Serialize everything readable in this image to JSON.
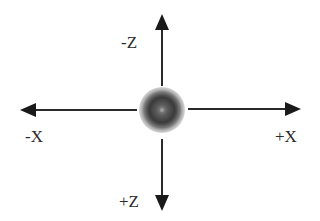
{
  "diagram": {
    "type": "coordinate-axes",
    "center": {
      "x": 162,
      "y": 110
    },
    "sphere": {
      "radius": 23,
      "color_outer": "#9a9a9a",
      "color_mid": "#3a3a3a",
      "color_inner": "#5a5a5a"
    },
    "line_color": "#2a2a2a",
    "axes": [
      {
        "id": "neg-z",
        "label": "-Z",
        "direction": "up"
      },
      {
        "id": "pos-z",
        "label": "+Z",
        "direction": "down"
      },
      {
        "id": "neg-x",
        "label": "-X",
        "direction": "left"
      },
      {
        "id": "pos-x",
        "label": "+X",
        "direction": "right"
      }
    ]
  },
  "labels": {
    "neg_z": "-Z",
    "pos_z": "+Z",
    "neg_x": "-X",
    "pos_x": "+X"
  }
}
